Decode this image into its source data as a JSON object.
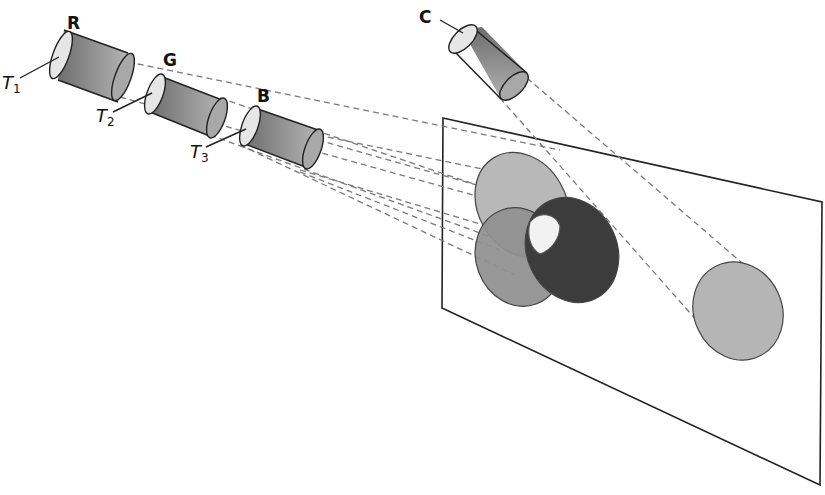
{
  "diagram": {
    "tubes": [
      {
        "id": "R",
        "label": "R",
        "tip_label": "T",
        "tip_sub": "1"
      },
      {
        "id": "G",
        "label": "G",
        "tip_label": "T",
        "tip_sub": "2"
      },
      {
        "id": "B",
        "label": "B",
        "tip_label": "T",
        "tip_sub": "3"
      },
      {
        "id": "C",
        "label": "C"
      }
    ],
    "screen": {
      "type": "projection-screen-parallelogram"
    },
    "spots": [
      {
        "id": "top-spot",
        "color": "#b8b8b8"
      },
      {
        "id": "left-spot",
        "color": "#8a8a8a"
      },
      {
        "id": "right-spot",
        "color": "#3a3a3a"
      },
      {
        "id": "overlap-center",
        "color": "#f2f2f2"
      },
      {
        "id": "c-spot",
        "color": "#b5b5b5"
      }
    ],
    "colors": {
      "tube_body_dark": "#7a7a7a",
      "tube_body_light": "#b0b0b0",
      "tube_face": "#e6e6e6",
      "line": "#222222",
      "dash": "#777777"
    }
  }
}
